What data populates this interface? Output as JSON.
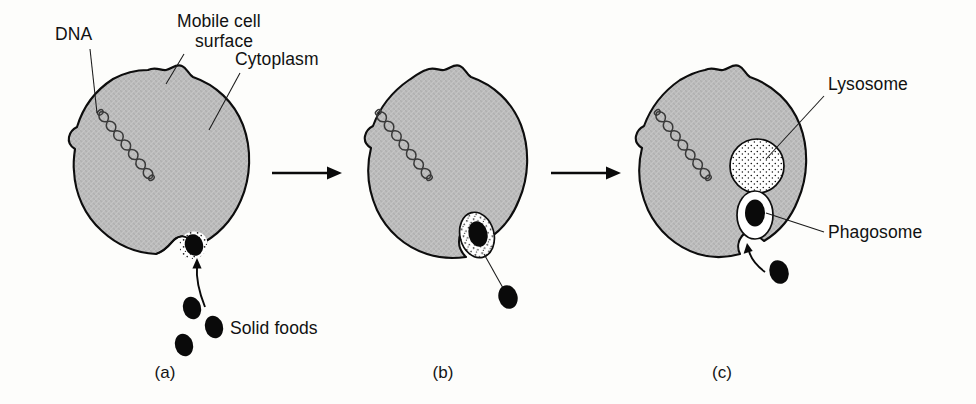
{
  "figure": {
    "background_color": "#fdfdfb",
    "cytoplasm_color": "#b9b9b9",
    "outline_color": "#0d0d0d",
    "food_color": "#0a0a0a",
    "vesicle_fill": "#ffffff"
  },
  "labels": {
    "dna": "DNA",
    "mobile_cell_surface_line1": "Mobile cell",
    "mobile_cell_surface_line2": "surface",
    "cytoplasm": "Cytoplasm",
    "solid_foods": "Solid foods",
    "lysosome": "Lysosome",
    "phagosome": "Phagosome"
  },
  "panels": [
    {
      "id": "a",
      "caption": "(a)",
      "description": "Solid food particles approach the mobile cell surface; a shallow phagocytic cup forms",
      "organelles": [
        "dna",
        "cytoplasm",
        "mobile cell surface",
        "phagocytic cup"
      ],
      "food_particles_outside": 3
    },
    {
      "id": "b",
      "caption": "(b)",
      "description": "The cell surface invaginates and engulfs a food particle into a forming vesicle",
      "organelles": [
        "dna",
        "cytoplasm",
        "forming phagosome"
      ],
      "food_particles_outside": 1
    },
    {
      "id": "c",
      "caption": "(c)",
      "description": "A lysosome approaches the phagosome containing the ingested food particle",
      "organelles": [
        "dna",
        "cytoplasm",
        "lysosome",
        "phagosome"
      ],
      "food_particles_outside": 1
    }
  ],
  "flow_arrows": [
    {
      "from": "a",
      "to": "b"
    },
    {
      "from": "b",
      "to": "c"
    }
  ]
}
